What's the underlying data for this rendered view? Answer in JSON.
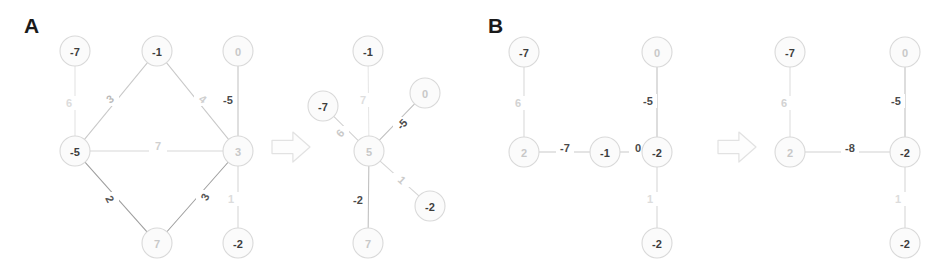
{
  "figure": {
    "width": 946,
    "height": 277,
    "background": "#ffffff"
  },
  "panels": [
    {
      "id": "A",
      "label": "A",
      "x": 24,
      "y": 14
    },
    {
      "id": "B",
      "label": "B",
      "x": 488,
      "y": 14
    }
  ],
  "arrows": [
    {
      "name": "transform-arrow-a",
      "x": 272,
      "y": 132,
      "width": 38,
      "height": 30,
      "color": "#e2e2e2"
    },
    {
      "name": "transform-arrow-b",
      "x": 718,
      "y": 132,
      "width": 38,
      "height": 30,
      "color": "#e2e2e2"
    }
  ],
  "colors": {
    "node_fill": "#fbfbfb",
    "node_stroke": "#d9d9d9",
    "dark_text": "#3d3d3d",
    "mid_text": "#9a9a9a",
    "faint_text": "#dcdcdc",
    "edge_dark": "#b0b0b0",
    "edge_faint": "#e0e0e0",
    "panel_letter": "#1a1a1a"
  },
  "chart_data": {
    "type": "diagram",
    "title": "",
    "graphs": [
      {
        "panel": "A",
        "side": "left",
        "name": "graph-a-before",
        "node_radius": 15,
        "nodes": [
          {
            "id": "a0",
            "label": "-7",
            "x": 75,
            "y": 51,
            "text_color": "#3d3d3d",
            "text_opacity": 1.0
          },
          {
            "id": "a1",
            "label": "-1",
            "x": 157,
            "y": 51,
            "text_color": "#3d3d3d",
            "text_opacity": 1.0
          },
          {
            "id": "a2",
            "label": "0",
            "x": 238,
            "y": 51,
            "text_color": "#c8c8c8",
            "text_opacity": 1.0
          },
          {
            "id": "a3",
            "label": "-5",
            "x": 75,
            "y": 151,
            "text_color": "#3d3d3d",
            "text_opacity": 1.0
          },
          {
            "id": "a4",
            "label": "3",
            "x": 238,
            "y": 151,
            "text_color": "#c8c8c8",
            "text_opacity": 1.0
          },
          {
            "id": "a5",
            "label": "7",
            "x": 157,
            "y": 243,
            "text_color": "#c8c8c8",
            "text_opacity": 1.0
          },
          {
            "id": "a6",
            "label": "-2",
            "x": 238,
            "y": 243,
            "text_color": "#3d3d3d",
            "text_opacity": 1.0
          }
        ],
        "edges": [
          {
            "from": "a0",
            "to": "a3",
            "weight": "6",
            "lx": 69,
            "ly": 103,
            "color": "#e3e3e3",
            "text_color": "#dcdcdc",
            "rotate": 0
          },
          {
            "from": "a3",
            "to": "a1",
            "weight": "3",
            "lx": 110,
            "ly": 99,
            "color": "#c9c9c9",
            "text_color": "#b9b9b9",
            "rotate": -38
          },
          {
            "from": "a1",
            "to": "a4",
            "weight": "4",
            "lx": 203,
            "ly": 99,
            "color": "#c9c9c9",
            "text_color": "#cfcfcf",
            "rotate": 38
          },
          {
            "from": "a2",
            "to": "a4",
            "weight": "-5",
            "lx": 228,
            "ly": 100,
            "color": "#c2c2c2",
            "text_color": "#4a4a4a",
            "rotate": 0
          },
          {
            "from": "a3",
            "to": "a4",
            "weight": "7",
            "lx": 158,
            "ly": 146,
            "color": "#d8d8d8",
            "text_color": "#d0d0d0",
            "rotate": 0
          },
          {
            "from": "a3",
            "to": "a5",
            "weight": "2",
            "lx": 110,
            "ly": 199,
            "color": "#9f9f9f",
            "text_color": "#555555",
            "rotate": 62
          },
          {
            "from": "a5",
            "to": "a4",
            "weight": "3",
            "lx": 205,
            "ly": 197,
            "color": "#9f9f9f",
            "text_color": "#555555",
            "rotate": -62
          },
          {
            "from": "a4",
            "to": "a6",
            "weight": "1",
            "lx": 231,
            "ly": 199,
            "color": "#d5d5d5",
            "text_color": "#dcdcdc",
            "rotate": 0
          }
        ]
      },
      {
        "panel": "A",
        "side": "right",
        "name": "graph-a-after",
        "node_radius": 15,
        "nodes": [
          {
            "id": "b0",
            "label": "-1",
            "x": 368,
            "y": 51,
            "text_color": "#3d3d3d",
            "text_opacity": 1.0
          },
          {
            "id": "b1",
            "label": "-7",
            "x": 323,
            "y": 106,
            "text_color": "#3d3d3d",
            "text_opacity": 1.0
          },
          {
            "id": "b2",
            "label": "0",
            "x": 425,
            "y": 93,
            "text_color": "#c8c8c8",
            "text_opacity": 1.0
          },
          {
            "id": "b3",
            "label": "5",
            "x": 369,
            "y": 151,
            "text_color": "#c8c8c8",
            "text_opacity": 1.0
          },
          {
            "id": "b4",
            "label": "-2",
            "x": 430,
            "y": 206,
            "text_color": "#3d3d3d",
            "text_opacity": 1.0
          },
          {
            "id": "b5",
            "label": "7",
            "x": 368,
            "y": 243,
            "text_color": "#c8c8c8",
            "text_opacity": 1.0
          }
        ],
        "edges": [
          {
            "from": "b0",
            "to": "b3",
            "weight": "7",
            "lx": 363,
            "ly": 100,
            "color": "#e6e6e6",
            "text_color": "#dedede",
            "rotate": 0
          },
          {
            "from": "b1",
            "to": "b3",
            "weight": "6",
            "lx": 340,
            "ly": 133,
            "color": "#d2d2d2",
            "text_color": "#c9c9c9",
            "rotate": -48
          },
          {
            "from": "b2",
            "to": "b3",
            "weight": "-5",
            "lx": 402,
            "ly": 124,
            "color": "#bfbfbf",
            "text_color": "#4a4a4a",
            "rotate": -47
          },
          {
            "from": "b3",
            "to": "b4",
            "weight": "1",
            "lx": 402,
            "ly": 180,
            "color": "#d5d5d5",
            "text_color": "#cacaca",
            "rotate": 43
          },
          {
            "from": "b3",
            "to": "b5",
            "weight": "-2",
            "lx": 358,
            "ly": 200,
            "color": "#bdbdbd",
            "text_color": "#4a4a4a",
            "rotate": 0
          }
        ]
      },
      {
        "panel": "B",
        "side": "left",
        "name": "graph-b-before",
        "node_radius": 15,
        "nodes": [
          {
            "id": "c0",
            "label": "-7",
            "x": 524,
            "y": 52,
            "text_color": "#3d3d3d",
            "text_opacity": 1.0
          },
          {
            "id": "c1",
            "label": "0",
            "x": 657,
            "y": 52,
            "text_color": "#c8c8c8",
            "text_opacity": 1.0
          },
          {
            "id": "c2",
            "label": "2",
            "x": 524,
            "y": 152,
            "text_color": "#c8c8c8",
            "text_opacity": 1.0
          },
          {
            "id": "c3",
            "label": "-1",
            "x": 605,
            "y": 152,
            "text_color": "#3d3d3d",
            "text_opacity": 1.0
          },
          {
            "id": "c4",
            "label": "-2",
            "x": 657,
            "y": 152,
            "text_color": "#3d3d3d",
            "text_opacity": 1.0
          },
          {
            "id": "c5",
            "label": "-2",
            "x": 657,
            "y": 243,
            "text_color": "#3d3d3d",
            "text_opacity": 1.0
          }
        ],
        "edges": [
          {
            "from": "c0",
            "to": "c2",
            "weight": "6",
            "lx": 518,
            "ly": 103,
            "color": "#d8d8d8",
            "text_color": "#d2d2d2",
            "rotate": 0
          },
          {
            "from": "c1",
            "to": "c4",
            "weight": "-5",
            "lx": 648,
            "ly": 101,
            "color": "#bfbfbf",
            "text_color": "#4a4a4a",
            "rotate": 0
          },
          {
            "from": "c2",
            "to": "c3",
            "weight": "-7",
            "lx": 565,
            "ly": 148,
            "color": "#c9c9c9",
            "text_color": "#4a4a4a",
            "rotate": 0
          },
          {
            "from": "c3",
            "to": "c4",
            "weight": "0",
            "lx": 638,
            "ly": 148,
            "color": "#c9c9c9",
            "text_color": "#4a4a4a",
            "rotate": 0
          },
          {
            "from": "c4",
            "to": "c5",
            "weight": "1",
            "lx": 650,
            "ly": 199,
            "color": "#d5d5d5",
            "text_color": "#dcdcdc",
            "rotate": 0
          }
        ]
      },
      {
        "panel": "B",
        "side": "right",
        "name": "graph-b-after",
        "node_radius": 15,
        "nodes": [
          {
            "id": "d0",
            "label": "-7",
            "x": 790,
            "y": 52,
            "text_color": "#3d3d3d",
            "text_opacity": 1.0
          },
          {
            "id": "d1",
            "label": "0",
            "x": 905,
            "y": 52,
            "text_color": "#c8c8c8",
            "text_opacity": 1.0
          },
          {
            "id": "d2",
            "label": "2",
            "x": 790,
            "y": 152,
            "text_color": "#c8c8c8",
            "text_opacity": 1.0
          },
          {
            "id": "d3",
            "label": "-2",
            "x": 905,
            "y": 152,
            "text_color": "#3d3d3d",
            "text_opacity": 1.0
          },
          {
            "id": "d4",
            "label": "-2",
            "x": 905,
            "y": 243,
            "text_color": "#3d3d3d",
            "text_opacity": 1.0
          }
        ],
        "edges": [
          {
            "from": "d0",
            "to": "d2",
            "weight": "6",
            "lx": 784,
            "ly": 103,
            "color": "#dcdcdc",
            "text_color": "#d2d2d2",
            "rotate": 0
          },
          {
            "from": "d1",
            "to": "d3",
            "weight": "-5",
            "lx": 896,
            "ly": 101,
            "color": "#bfbfbf",
            "text_color": "#4a4a4a",
            "rotate": 0
          },
          {
            "from": "d2",
            "to": "d3",
            "weight": "-8",
            "lx": 850,
            "ly": 148,
            "color": "#d2d2d2",
            "text_color": "#4a4a4a",
            "rotate": 0
          },
          {
            "from": "d3",
            "to": "d4",
            "weight": "1",
            "lx": 898,
            "ly": 199,
            "color": "#d5d5d5",
            "text_color": "#dcdcdc",
            "rotate": 0
          }
        ]
      }
    ]
  }
}
